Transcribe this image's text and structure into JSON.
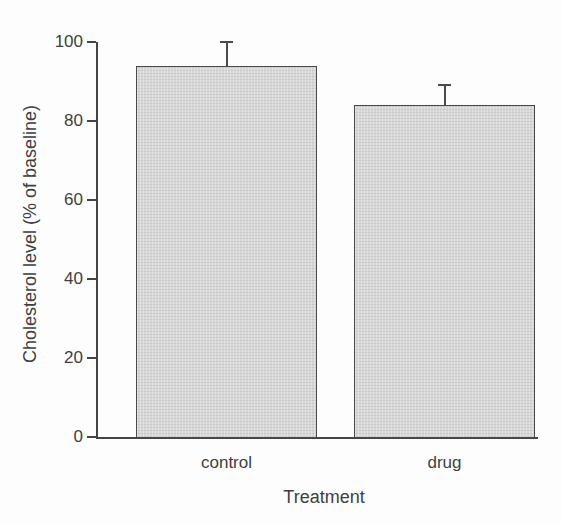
{
  "figure": {
    "background": "#fdfdfd",
    "ink_color": "#3f3f3f",
    "axis_color": "#454545"
  },
  "chart_data": {
    "type": "bar",
    "categories": [
      "control",
      "drug"
    ],
    "values": [
      94,
      84
    ],
    "errors_plus": [
      6,
      5
    ],
    "title": "",
    "xlabel": "Treatment",
    "ylabel": "Cholesterol level (% of baseline)",
    "ylim": [
      0,
      100
    ],
    "yticks": [
      0,
      20,
      40,
      60,
      80,
      100
    ],
    "grid": false,
    "legend": "none",
    "bar_fill": "#d7d7d7",
    "bar_border": "#4a4a4a",
    "error_color": "#4a4a4a",
    "error_cap_style": "top-only"
  }
}
